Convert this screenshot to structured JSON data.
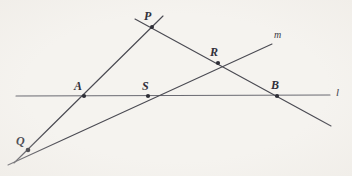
{
  "figure": {
    "background_color": "#f5f3ef",
    "stroke_color": "#4a4a52",
    "label_color": "#30303a",
    "width": 352,
    "height": 176
  },
  "points": [
    {
      "id": "P",
      "label": "P",
      "x": 152,
      "y": 27,
      "label_x": 144,
      "label_y": 10
    },
    {
      "id": "R",
      "label": "R",
      "x": 218,
      "y": 63,
      "label_x": 210,
      "label_y": 46
    },
    {
      "id": "A",
      "label": "A",
      "x": 84,
      "y": 96,
      "label_x": 74,
      "label_y": 80
    },
    {
      "id": "S",
      "label": "S",
      "x": 148,
      "y": 96,
      "label_x": 142,
      "label_y": 80
    },
    {
      "id": "B",
      "label": "B",
      "x": 277,
      "y": 96,
      "label_x": 271,
      "label_y": 79
    },
    {
      "id": "Q",
      "label": "Q",
      "x": 28,
      "y": 150,
      "label_x": 16,
      "label_y": 135
    }
  ],
  "lines": [
    {
      "id": "l",
      "label": "l",
      "description": "horizontal base line through A, S and B",
      "x1": 16,
      "y1": 96,
      "x2": 330,
      "y2": 95,
      "label_x": 336,
      "label_y": 87
    },
    {
      "id": "m",
      "label": "m",
      "description": "ray from Q through S and R rising to the upper right",
      "x1": 8,
      "y1": 165,
      "x2": 272,
      "y2": 44,
      "label_x": 274,
      "label_y": 30
    },
    {
      "id": "QP",
      "label": "",
      "description": "line from lower left through Q, A up to P and beyond",
      "x1": 14,
      "y1": 163,
      "x2": 163,
      "y2": 16,
      "label_x": 0,
      "label_y": 0
    },
    {
      "id": "PB",
      "label": "",
      "description": "line from P descending through R and B to the lower right",
      "x1": 135,
      "y1": 19,
      "x2": 331,
      "y2": 126,
      "label_x": 0,
      "label_y": 0
    }
  ],
  "labels": {
    "P": "P",
    "R": "R",
    "A": "A",
    "S": "S",
    "B": "B",
    "Q": "Q",
    "l": "l",
    "m": "m"
  }
}
